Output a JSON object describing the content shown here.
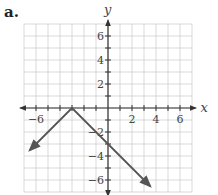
{
  "panel_label": "a.",
  "chart_data": {
    "type": "line",
    "title": "",
    "xlabel": "x",
    "ylabel": "y",
    "xlim": [
      -7,
      7
    ],
    "ylim": [
      -7,
      7
    ],
    "grid": true,
    "x_ticks": [
      -6,
      2,
      4,
      6
    ],
    "y_ticks": [
      6,
      4,
      2,
      -2,
      -4,
      -6
    ],
    "x_tick_labels": [
      "−6",
      "2",
      "4",
      "6"
    ],
    "y_tick_labels": [
      "6",
      "4",
      "2",
      "−2",
      "−4",
      "−6"
    ],
    "series": [
      {
        "name": "y = -|x + 3|",
        "points": [
          [
            -6.5,
            -3.5
          ],
          [
            -3,
            0
          ],
          [
            3.5,
            -6.5
          ]
        ],
        "vertex": [
          -3,
          0
        ],
        "y_intercept": [
          0,
          -3
        ],
        "arrows": "both ends"
      }
    ],
    "colors": {
      "line": "#555555",
      "grid": "#cfcfcf",
      "axis": "#333333"
    }
  }
}
